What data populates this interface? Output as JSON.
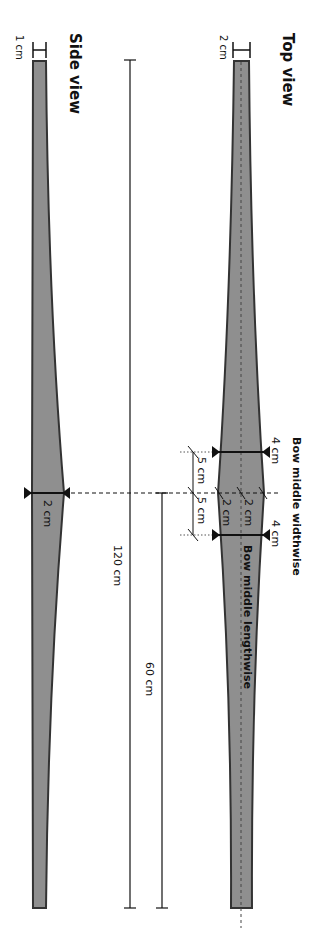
{
  "diagram": {
    "top_view": {
      "title": "Top view",
      "tip_width_label": "2 cm",
      "middle_width_label_upper": "4 cm",
      "middle_width_label_lower": "4 cm",
      "half_width_label_left": "2 cm",
      "half_width_label_right": "2 cm",
      "offset_label_upper": "5 cm",
      "offset_label_lower": "5 cm",
      "lengthwise_label": "Bow middle lengthwise",
      "widthwise_label": "Bow middle widthwise"
    },
    "side_view": {
      "title": "Side view",
      "tip_thickness_label": "1 cm",
      "middle_thickness_label": "2 cm"
    },
    "dimensions": {
      "total_length_label": "120 cm",
      "half_length_label": "60 cm"
    },
    "colors": {
      "bow_fill": "#8f8f8f",
      "bow_stroke": "#333333",
      "line": "#111111"
    }
  }
}
